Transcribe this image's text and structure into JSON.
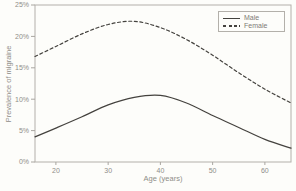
{
  "figure": {
    "background": "#fdfdfa",
    "frame_color": "#b3b0aa",
    "tick_color": "#a9a6a0",
    "text_color": "#8f8d88",
    "line_color": "#44423e"
  },
  "chart_data": {
    "type": "line",
    "title": "",
    "xlabel": "Age (years)",
    "ylabel": "Prevalence of migraine",
    "x": [
      16,
      20,
      25,
      30,
      35,
      40,
      45,
      50,
      55,
      60,
      65
    ],
    "series": [
      {
        "name": "Male",
        "style": "solid",
        "color": "#44423e",
        "values": [
          4.0,
          5.4,
          7.2,
          9.1,
          10.3,
          10.6,
          9.4,
          7.4,
          5.5,
          3.6,
          2.2
        ]
      },
      {
        "name": "Female",
        "style": "dashed",
        "color": "#44423e",
        "values": [
          16.8,
          18.4,
          20.4,
          21.9,
          22.4,
          21.4,
          19.5,
          17.0,
          14.2,
          11.6,
          9.4
        ]
      }
    ],
    "xlim": [
      16,
      65
    ],
    "ylim": [
      0,
      25
    ],
    "xticks": [
      20,
      30,
      40,
      50,
      60
    ],
    "xtick_labels": [
      "20",
      "30",
      "40",
      "50",
      "60"
    ],
    "ytick_values": [
      0,
      5,
      10,
      15,
      20,
      25
    ],
    "ytick_labels": [
      "0%",
      "5%",
      "10%",
      "15%",
      "20%",
      "25%"
    ],
    "legend_position": "top-right",
    "grid": false
  }
}
